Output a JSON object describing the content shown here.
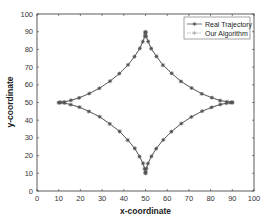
{
  "chart_data": {
    "type": "line",
    "title": "",
    "xlabel": "x-coordinate",
    "ylabel": "y-coordinate",
    "xlim": [
      0,
      100
    ],
    "ylim": [
      0,
      100
    ],
    "xticks": [
      0,
      10,
      20,
      30,
      40,
      50,
      60,
      70,
      80,
      90,
      100
    ],
    "yticks": [
      0,
      10,
      20,
      30,
      40,
      50,
      60,
      70,
      80,
      90,
      100
    ],
    "grid": false,
    "legend_position": "upper right",
    "series": [
      {
        "name": "Real Trajectory",
        "color": "#555555",
        "marker": "asterisk",
        "x": [
          90,
          89.35,
          87.43,
          84.41,
          80.5,
          75.98,
          71.18,
          66.42,
          61.98,
          58.12,
          55,
          52.69,
          51.18,
          50.36,
          50.05,
          50,
          49.95,
          49.64,
          48.82,
          47.31,
          45,
          41.88,
          38.02,
          33.58,
          28.82,
          24.02,
          19.5,
          15.59,
          12.57,
          10.65,
          10,
          10.65,
          12.57,
          15.59,
          19.5,
          24.02,
          28.82,
          33.58,
          38.02,
          41.88,
          45,
          47.31,
          48.82,
          49.64,
          49.95,
          50,
          50.05,
          50.36,
          51.18,
          52.69,
          55,
          58.12,
          61.98,
          66.42,
          71.18,
          75.98,
          80.5,
          84.41,
          87.43,
          89.35,
          90
        ],
        "y": [
          50,
          50.05,
          50.36,
          51.18,
          52.69,
          55,
          58.12,
          61.98,
          66.42,
          71.18,
          75.98,
          80.5,
          84.41,
          87.43,
          89.35,
          90,
          89.35,
          87.43,
          84.41,
          80.5,
          75.98,
          71.18,
          66.42,
          61.98,
          58.12,
          55,
          52.69,
          51.18,
          50.36,
          50.05,
          50,
          49.95,
          49.64,
          48.82,
          47.31,
          45,
          41.88,
          38.02,
          33.58,
          28.82,
          24.02,
          19.5,
          15.59,
          12.57,
          10.65,
          10,
          10.65,
          12.57,
          15.59,
          19.5,
          24.02,
          28.82,
          33.58,
          38.02,
          41.88,
          45,
          47.31,
          48.82,
          49.64,
          49.95,
          50
        ]
      },
      {
        "name": "Our Algorithm",
        "color": "#a8a8a8",
        "marker": "star",
        "x": [
          90.3,
          89.1,
          87.7,
          84.2,
          80.8,
          75.7,
          71.4,
          66.1,
          62.3,
          57.8,
          55.3,
          52.4,
          51.4,
          50.1,
          50.3,
          49.8,
          49.7,
          49.9,
          48.6,
          47.6,
          44.7,
          42.1,
          37.7,
          33.9,
          28.5,
          24.3,
          19.2,
          15.8,
          12.3,
          10.9,
          9.8,
          10.4,
          12.8,
          15.3,
          19.8,
          23.7,
          29.1,
          33.3,
          38.3,
          41.6,
          45.3,
          47.0,
          49.1,
          49.4,
          50.2,
          50.1,
          49.8,
          50.6,
          50.9,
          52.9,
          54.7,
          58.4,
          61.7,
          66.7,
          70.9,
          76.3,
          80.2,
          84.7,
          87.1,
          89.6,
          89.8
        ],
        "y": [
          50.2,
          49.8,
          50.6,
          50.9,
          52.9,
          54.7,
          58.4,
          61.7,
          66.7,
          70.9,
          76.2,
          80.3,
          84.6,
          87.2,
          89.6,
          89.7,
          89.1,
          87.7,
          84.2,
          80.8,
          75.7,
          71.4,
          66.1,
          62.3,
          57.8,
          55.3,
          52.4,
          51.4,
          50.1,
          50.3,
          49.8,
          49.7,
          49.9,
          48.6,
          47.6,
          44.7,
          42.1,
          37.7,
          33.9,
          28.5,
          24.3,
          19.2,
          15.8,
          12.3,
          10.9,
          9.8,
          10.4,
          12.8,
          15.3,
          19.8,
          23.7,
          29.1,
          33.3,
          38.3,
          41.6,
          45.3,
          47.0,
          49.1,
          49.4,
          50.2,
          50.1
        ]
      }
    ]
  },
  "legend": {
    "items": [
      {
        "label": "Real Trajectory"
      },
      {
        "label": "Our Algorithm"
      }
    ]
  },
  "axes": {
    "xlabel": "x-coordinate",
    "ylabel": "y-coordinate"
  }
}
